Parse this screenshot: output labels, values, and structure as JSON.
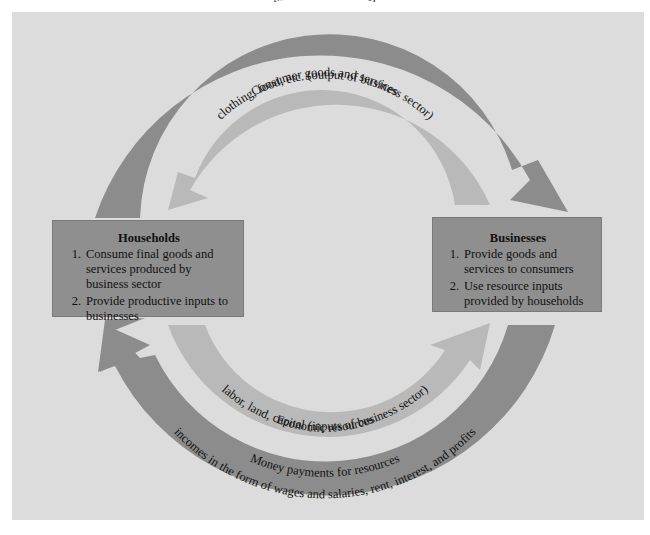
{
  "diagram": {
    "colors": {
      "background": "#dcdcdc",
      "dark_arrow": "#8c8c8c",
      "light_arrow": "#b9b9b9",
      "box_fill": "#8f8f8f",
      "text": "#111111"
    },
    "households": {
      "title": "Households",
      "items": [
        {
          "num": "1.",
          "text": "Consume final goods and services produced by business sector"
        },
        {
          "num": "2.",
          "text": "Provide productive inputs to businesses"
        }
      ]
    },
    "businesses": {
      "title": "Businesses",
      "items": [
        {
          "num": "1.",
          "text": "Provide goods and services to consumers"
        },
        {
          "num": "2.",
          "text": "Use resource inputs provided by households"
        }
      ]
    },
    "flows": {
      "top_outer": {
        "line1": "Money payments for",
        "line2": "consumer goods and services",
        "direction": "households-to-businesses"
      },
      "top_inner": {
        "line1": "Consumer goods and services",
        "line2": "clothing, food, etc. (output of business sector)",
        "direction": "businesses-to-households"
      },
      "bottom_inner": {
        "line1": "Economic resources",
        "line2": "labor, land, capital (inputs of business sector)",
        "direction": "households-to-businesses"
      },
      "bottom_outer": {
        "line1": "Money payments for resources",
        "line2": "incomes in the form of wages and salaries, rent, interest, and profits",
        "direction": "businesses-to-households"
      }
    }
  }
}
